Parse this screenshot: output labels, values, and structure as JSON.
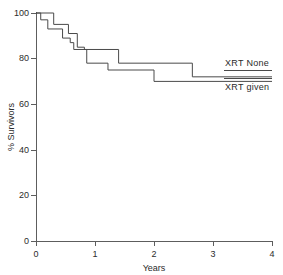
{
  "chart_data": {
    "type": "line",
    "title": "",
    "subtitle": "",
    "xlabel": "Years",
    "ylabel": "% Survivors",
    "xlim": [
      0,
      4
    ],
    "ylim": [
      0,
      100
    ],
    "xticks": [
      0,
      1,
      2,
      3,
      4
    ],
    "xtick_labels": [
      "0",
      "1",
      "2",
      "3",
      "4"
    ],
    "yticks": [
      0,
      20,
      40,
      60,
      80,
      100
    ],
    "ytick_labels": [
      "0",
      "20",
      "40",
      "60",
      "80",
      "100"
    ],
    "grid": false,
    "legend_position": "right-inline",
    "step_style": "post",
    "series": [
      {
        "name": "XRT None",
        "label": "XRT None",
        "color": "#4a4a4a",
        "x": [
          0,
          0.3,
          0.3,
          0.55,
          0.55,
          0.7,
          0.7,
          0.82,
          0.82,
          1.4,
          1.4,
          2.65,
          2.65,
          4.0
        ],
        "y": [
          100,
          100,
          95,
          95,
          91,
          91,
          85,
          85,
          84,
          84,
          78,
          78,
          72,
          72
        ],
        "points": [
          {
            "x": 0.0,
            "y": 100
          },
          {
            "x": 0.3,
            "y": 95
          },
          {
            "x": 0.55,
            "y": 91
          },
          {
            "x": 0.7,
            "y": 85
          },
          {
            "x": 0.82,
            "y": 84
          },
          {
            "x": 1.4,
            "y": 78
          },
          {
            "x": 2.65,
            "y": 72
          },
          {
            "x": 4.0,
            "y": 72
          }
        ]
      },
      {
        "name": "XRT given",
        "label": "XRT given",
        "color": "#4a4a4a",
        "x": [
          0,
          0.08,
          0.08,
          0.2,
          0.2,
          0.45,
          0.45,
          0.58,
          0.58,
          0.64,
          0.64,
          0.86,
          0.86,
          1.22,
          1.22,
          2.0,
          2.0,
          4.0
        ],
        "y": [
          100,
          100,
          97,
          97,
          93,
          93,
          89,
          89,
          87,
          87,
          84,
          84,
          78,
          78,
          75,
          75,
          70,
          70
        ],
        "points": [
          {
            "x": 0.0,
            "y": 100
          },
          {
            "x": 0.08,
            "y": 97
          },
          {
            "x": 0.2,
            "y": 93
          },
          {
            "x": 0.45,
            "y": 89
          },
          {
            "x": 0.58,
            "y": 87
          },
          {
            "x": 0.64,
            "y": 84
          },
          {
            "x": 0.86,
            "y": 78
          },
          {
            "x": 1.22,
            "y": 75
          },
          {
            "x": 2.0,
            "y": 70
          },
          {
            "x": 4.0,
            "y": 70
          }
        ]
      }
    ],
    "annotations": [
      {
        "text": "XRT None",
        "x": 2.9,
        "y": 75,
        "name": "label-xrt-none"
      },
      {
        "text": "XRT given",
        "x": 2.9,
        "y": 64,
        "name": "label-xrt-given"
      }
    ]
  }
}
